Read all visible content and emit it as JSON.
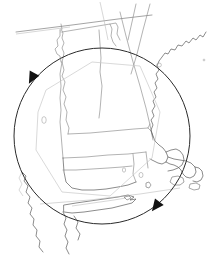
{
  "figure": {
    "title": "New England region map with circular rotation selector",
    "background_color": "#ffffff",
    "width": 219,
    "height": 260
  },
  "overlay": {
    "type": "circular-rotation-handle",
    "circle": {
      "center_x": 102,
      "center_y": 136,
      "radius": 88,
      "stroke_color": "#2b2b2b",
      "stroke_width": 1.0
    },
    "handles": [
      {
        "name": "rotate-handle-upper-left",
        "x": 32,
        "y": 78,
        "angle_deg": 208,
        "direction": "counter-clockwise",
        "fill_color": "#121212"
      },
      {
        "name": "rotate-handle-lower-right",
        "x": 156,
        "y": 206,
        "angle_deg": 38,
        "direction": "clockwise",
        "fill_color": "#121212"
      }
    ]
  },
  "map": {
    "projection_note": "oblique / rotated",
    "stroke_colors": {
      "coastline": "#5a5a5a",
      "state_border": "#8a8a8a",
      "international_border": "#7d7d7d",
      "region_polygon": "#c9c9c9",
      "island": "#6a6a6a"
    },
    "features": [
      {
        "name": "canada-us-border",
        "kind": "international-border"
      },
      {
        "name": "vermont-new-hampshire-border",
        "kind": "state-border"
      },
      {
        "name": "new-hampshire-maine-border",
        "kind": "state-border"
      },
      {
        "name": "new-york-vermont-border",
        "kind": "state-border"
      },
      {
        "name": "massachusetts-north-border",
        "kind": "state-border"
      },
      {
        "name": "massachusetts-south-border",
        "kind": "state-border"
      },
      {
        "name": "connecticut-rhode-island-border",
        "kind": "state-border"
      },
      {
        "name": "atlantic-coastline",
        "kind": "coastline"
      },
      {
        "name": "cape-cod",
        "kind": "coastline"
      },
      {
        "name": "marthas-vineyard",
        "kind": "island"
      },
      {
        "name": "nantucket",
        "kind": "island"
      },
      {
        "name": "long-island",
        "kind": "island"
      },
      {
        "name": "block-island",
        "kind": "island"
      },
      {
        "name": "hudson-river",
        "kind": "hydrography"
      },
      {
        "name": "lake-champlain",
        "kind": "hydrography"
      },
      {
        "name": "selection-region-polygon",
        "kind": "region-polygon"
      }
    ]
  }
}
